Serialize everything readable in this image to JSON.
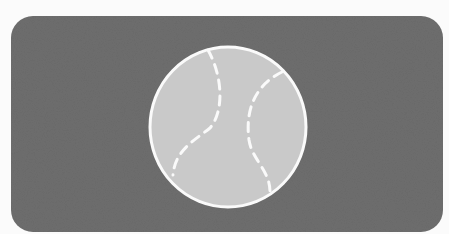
{
  "illustration": {
    "subject": "baseball-icon",
    "colors": {
      "page_background": "#fbfbfb",
      "panel_background": "#6e6e6e",
      "ball_fill": "#c9c9c9",
      "ball_outline": "#fafafa",
      "seam_stroke": "#fafafa"
    }
  }
}
